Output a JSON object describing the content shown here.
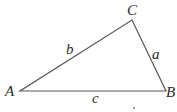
{
  "diagram": {
    "type": "triangle",
    "stroke_color": "#555555",
    "text_color": "#2a2a2a",
    "vertices": [
      {
        "id": "A",
        "label": "A",
        "x": 20,
        "y": 91
      },
      {
        "id": "B",
        "label": "B",
        "x": 166,
        "y": 91
      },
      {
        "id": "C",
        "label": "C",
        "x": 132,
        "y": 20
      }
    ],
    "sides": [
      {
        "id": "a",
        "label": "a",
        "from": "B",
        "to": "C"
      },
      {
        "id": "b",
        "label": "b",
        "from": "A",
        "to": "C"
      },
      {
        "id": "c",
        "label": "c",
        "from": "A",
        "to": "B"
      }
    ]
  }
}
